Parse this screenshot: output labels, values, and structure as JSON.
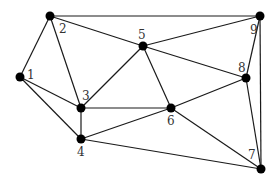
{
  "graph": {
    "type": "undirected-graph",
    "nodes": [
      {
        "id": "1",
        "label": "1",
        "x": 20,
        "y": 77,
        "lx": 27,
        "ly": 79
      },
      {
        "id": "2",
        "label": "2",
        "x": 50,
        "y": 16,
        "lx": 59,
        "ly": 33
      },
      {
        "id": "3",
        "label": "3",
        "x": 81,
        "y": 108,
        "lx": 82,
        "ly": 100
      },
      {
        "id": "4",
        "label": "4",
        "x": 81,
        "y": 139,
        "lx": 77,
        "ly": 156
      },
      {
        "id": "5",
        "label": "5",
        "x": 143,
        "y": 46,
        "lx": 138,
        "ly": 39
      },
      {
        "id": "6",
        "label": "6",
        "x": 171,
        "y": 108,
        "lx": 167,
        "ly": 125
      },
      {
        "id": "7",
        "label": "7",
        "x": 261,
        "y": 169,
        "lx": 248,
        "ly": 159
      },
      {
        "id": "8",
        "label": "8",
        "x": 246,
        "y": 78,
        "lx": 238,
        "ly": 72
      },
      {
        "id": "9",
        "label": "9",
        "x": 260,
        "y": 16,
        "lx": 250,
        "ly": 34
      }
    ],
    "edges": [
      [
        "1",
        "2"
      ],
      [
        "1",
        "3"
      ],
      [
        "1",
        "4"
      ],
      [
        "2",
        "3"
      ],
      [
        "2",
        "5"
      ],
      [
        "2",
        "9"
      ],
      [
        "3",
        "4"
      ],
      [
        "3",
        "5"
      ],
      [
        "3",
        "6"
      ],
      [
        "4",
        "6"
      ],
      [
        "4",
        "7"
      ],
      [
        "5",
        "6"
      ],
      [
        "5",
        "8"
      ],
      [
        "5",
        "9"
      ],
      [
        "6",
        "7"
      ],
      [
        "6",
        "8"
      ],
      [
        "8",
        "9"
      ],
      [
        "8",
        "7"
      ],
      [
        "9",
        "7"
      ]
    ]
  },
  "colors": {
    "edge": "#1a1a1a",
    "node": "#000000",
    "label": "#333333",
    "background": "#ffffff"
  }
}
